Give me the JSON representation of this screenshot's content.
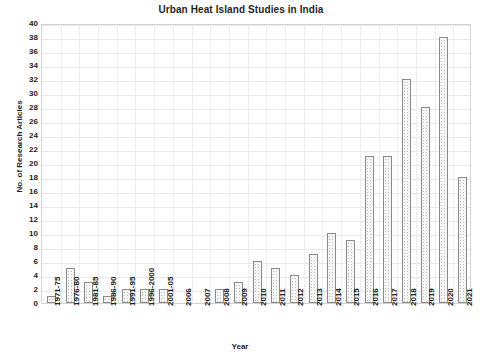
{
  "chart_data": {
    "type": "bar",
    "title": "Urban Heat Island Studies in India",
    "xlabel": "Year",
    "ylabel": "No. of Research Articles",
    "ylim": [
      0,
      40
    ],
    "ytick_step": 2,
    "grid": true,
    "legend": null,
    "bar_color": "#b5b5b5",
    "bar_edge_color": "#8a8a8a",
    "bar_pattern": "cross-hatch",
    "categories": [
      "1971-75",
      "1976-80",
      "1981-85",
      "1986-90",
      "1991-95",
      "1996-2000",
      "2001-05",
      "2006",
      "2007",
      "2008",
      "2009",
      "2010",
      "2011",
      "2012",
      "2013",
      "2014",
      "2015",
      "2016",
      "2017",
      "2018",
      "2019",
      "2020",
      "2021"
    ],
    "values": [
      1,
      5,
      3,
      1,
      2,
      2,
      2,
      0,
      0,
      2,
      3,
      6,
      5,
      4,
      7,
      10,
      9,
      21,
      21,
      32,
      28,
      38,
      18
    ],
    "yticks": [
      0,
      2,
      4,
      6,
      8,
      10,
      12,
      14,
      16,
      18,
      20,
      22,
      24,
      26,
      28,
      30,
      32,
      34,
      36,
      38,
      40
    ]
  }
}
